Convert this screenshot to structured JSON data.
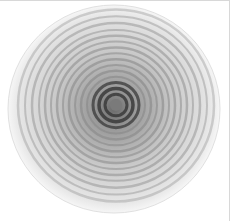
{
  "image": {
    "subject": "ceramic plate with concentric spiral grey rings",
    "background_color": "#ffffff",
    "plate": {
      "center_x": 115,
      "center_y": 104,
      "radius_x": 106,
      "radius_y": 104,
      "rim_color": "#f4f4f4",
      "ring_color": "#8a8a8a",
      "center_color": "#3a3a3a"
    },
    "rings": [
      {
        "r": 98,
        "w": 2.5,
        "o": 0.35
      },
      {
        "r": 91,
        "w": 2.0,
        "o": 0.4
      },
      {
        "r": 84,
        "w": 2.5,
        "o": 0.45
      },
      {
        "r": 77,
        "w": 2.0,
        "o": 0.45
      },
      {
        "r": 71,
        "w": 2.5,
        "o": 0.5
      },
      {
        "r": 65,
        "w": 2.0,
        "o": 0.5
      },
      {
        "r": 59,
        "w": 2.5,
        "o": 0.55
      },
      {
        "r": 53,
        "w": 2.0,
        "o": 0.55
      },
      {
        "r": 47,
        "w": 2.5,
        "o": 0.6
      },
      {
        "r": 41,
        "w": 2.0,
        "o": 0.6
      },
      {
        "r": 35,
        "w": 2.5,
        "o": 0.65
      },
      {
        "r": 29,
        "w": 2.0,
        "o": 0.65
      },
      {
        "r": 23,
        "w": 3.0,
        "o": 0.75
      },
      {
        "r": 17,
        "w": 3.5,
        "o": 0.85
      },
      {
        "r": 11,
        "w": 3.0,
        "o": 0.85
      }
    ]
  }
}
